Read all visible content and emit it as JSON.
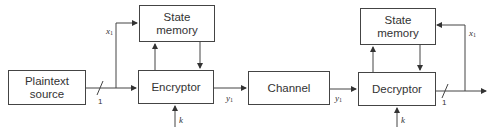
{
  "diagram": {
    "type": "block-diagram",
    "nodes": {
      "plaintext_source": "Plaintext source",
      "enc_state_memory": "State memory",
      "encryptor": "Encryptor",
      "channel": "Channel",
      "dec_state_memory": "State memory",
      "decryptor": "Decryptor"
    },
    "labels": {
      "x": "x",
      "x_sub": "1",
      "y": "y",
      "y_sub": "1",
      "k": "k",
      "bus_width": "1"
    },
    "edges": [
      {
        "from": "Plaintext source",
        "to": "Encryptor",
        "label": "1"
      },
      {
        "from": "Plaintext source",
        "to": "State memory (enc)",
        "label": "x1"
      },
      {
        "from": "Encryptor",
        "to": "State memory (enc)"
      },
      {
        "from": "State memory (enc)",
        "to": "Encryptor"
      },
      {
        "from": "k",
        "to": "Encryptor"
      },
      {
        "from": "Encryptor",
        "to": "Channel",
        "label": "y1"
      },
      {
        "from": "Channel",
        "to": "Decryptor",
        "label": "y1"
      },
      {
        "from": "Decryptor",
        "to": "State memory (dec)"
      },
      {
        "from": "State memory (dec)",
        "to": "Decryptor"
      },
      {
        "from": "k",
        "to": "Decryptor"
      },
      {
        "from": "Decryptor",
        "to": "output",
        "label": "1"
      },
      {
        "from": "output",
        "to": "State memory (dec)",
        "label": "x1"
      }
    ],
    "line_color": "#444444"
  }
}
